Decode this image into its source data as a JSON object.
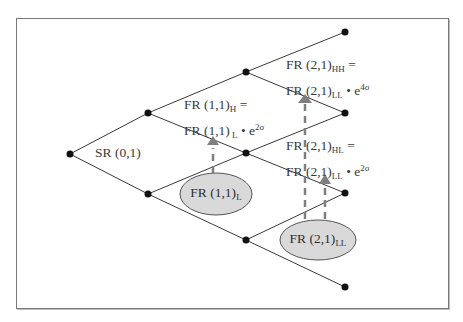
{
  "diagram": {
    "type": "binomial-interest-rate-tree",
    "colors": {
      "line": "#3a3a3a",
      "node": "#111111",
      "ellipse_fill": "#d9d9d9",
      "arrow": "#7f7f7f",
      "frame": "#7a7a7a"
    },
    "root_label": {
      "text": "SR (0,1)"
    },
    "labels": {
      "fr11h": {
        "line1_main": "FR (1,1)",
        "line1_sub": "H",
        "line1_tail": " =",
        "line2_main": "FR (1,1)",
        "line2_sub": " L",
        "line2_mid": " • e",
        "line2_sup": "2σ"
      },
      "fr21hh": {
        "line1_main": "FR (2,1)",
        "line1_sub": "HH",
        "line1_tail": " =",
        "line2_main": "FR (2,1)",
        "line2_sub": "LL",
        "line2_mid": " • e",
        "line2_sup": "4σ"
      },
      "fr21hl": {
        "line1_main": "FR (2,1)",
        "line1_sub": "HL",
        "line1_tail": " =",
        "line2_main": "FR (2,1)",
        "line2_sub": "LL",
        "line2_mid": " • e",
        "line2_sup": "2σ"
      }
    },
    "ellipses": {
      "fr11l": {
        "main": "FR (1,1)",
        "sub": "L"
      },
      "fr21ll": {
        "main": "FR (2,1)",
        "sub": "LL"
      }
    },
    "nodes": [
      {
        "id": "n0",
        "x": 70,
        "y": 154
      },
      {
        "id": "n1u",
        "x": 148,
        "y": 113
      },
      {
        "id": "n1d",
        "x": 148,
        "y": 194
      },
      {
        "id": "n2u",
        "x": 246,
        "y": 72
      },
      {
        "id": "n2m",
        "x": 246,
        "y": 153
      },
      {
        "id": "n2d",
        "x": 246,
        "y": 240
      },
      {
        "id": "n3a",
        "x": 345,
        "y": 32
      },
      {
        "id": "n3b",
        "x": 345,
        "y": 113
      },
      {
        "id": "n3c",
        "x": 345,
        "y": 193
      },
      {
        "id": "n3d",
        "x": 345,
        "y": 287
      }
    ]
  }
}
